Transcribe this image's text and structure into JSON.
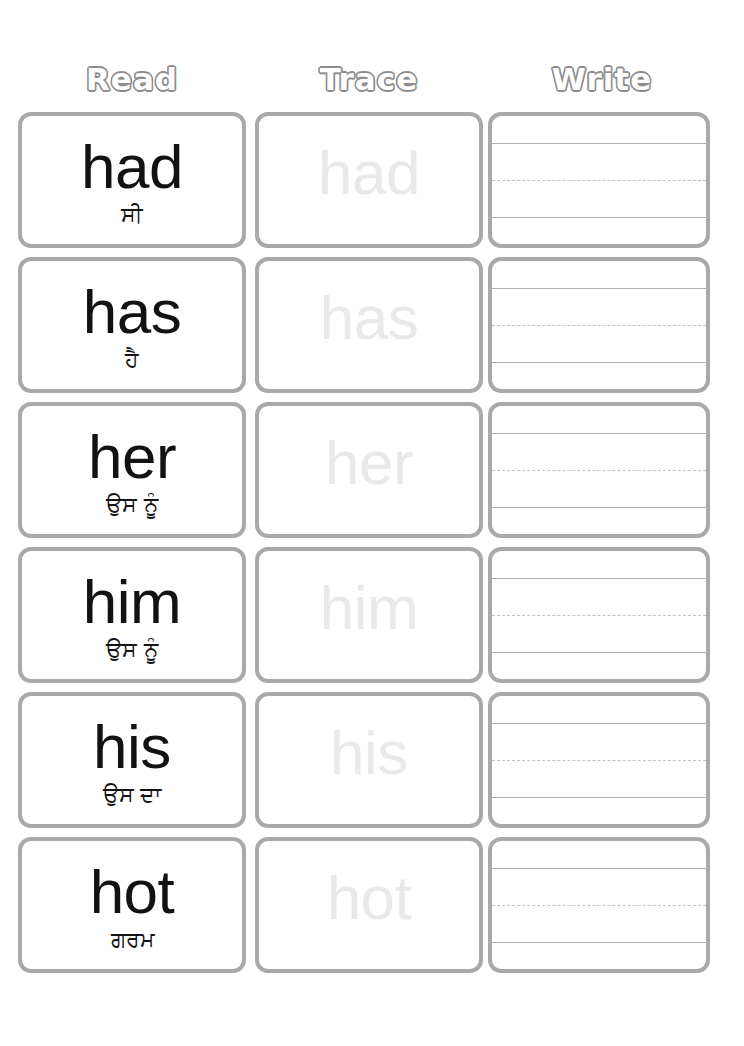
{
  "worksheet": {
    "columns": [
      {
        "id": "read",
        "label": "Read"
      },
      {
        "id": "trace",
        "label": "Trace"
      },
      {
        "id": "write",
        "label": "Write"
      }
    ],
    "colors": {
      "border": "#a9a9a9",
      "header_outline": "#8d8d8d",
      "header_fill": "#ffffff",
      "word_text": "#121212",
      "trace_text": "#e9e9e9",
      "guide_solid": "#adadad",
      "guide_dotted": "#c2c2c2",
      "background": "#ffffff"
    },
    "rows": [
      {
        "word": "had",
        "translation": "ਸੀ",
        "trace": "had"
      },
      {
        "word": "has",
        "translation": "ਹੈ",
        "trace": "has"
      },
      {
        "word": "her",
        "translation": "ਉਸ ਨੂੰ",
        "trace": "her"
      },
      {
        "word": "him",
        "translation": "ਉਸ ਨੂੰ",
        "trace": "him"
      },
      {
        "word": "his",
        "translation": "ਉਸ ਦਾ",
        "trace": "his"
      },
      {
        "word": "hot",
        "translation": "ਗਰਮ",
        "trace": "hot"
      }
    ]
  }
}
